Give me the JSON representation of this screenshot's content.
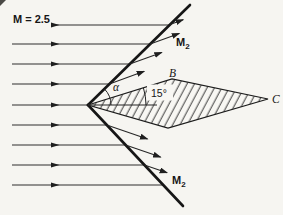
{
  "figure": {
    "freestream_label": "M = 2.5",
    "upper_mach_label": {
      "base": "M",
      "sub": "2"
    },
    "lower_mach_label": {
      "base": "M",
      "sub": "2"
    },
    "angle_alpha_label": "α",
    "angle_wedge_label": "15°",
    "point_b_label": "B",
    "point_c_label": "C"
  },
  "values": {
    "freestream_mach": 2.5,
    "wedge_half_angle_deg": 15,
    "num_streamlines": 9,
    "num_upper_deflected_arrows": 4,
    "num_lower_deflected_arrows": 3
  },
  "colors": {
    "ink": "#1c1c1c",
    "paper": "#f6f5f1"
  }
}
